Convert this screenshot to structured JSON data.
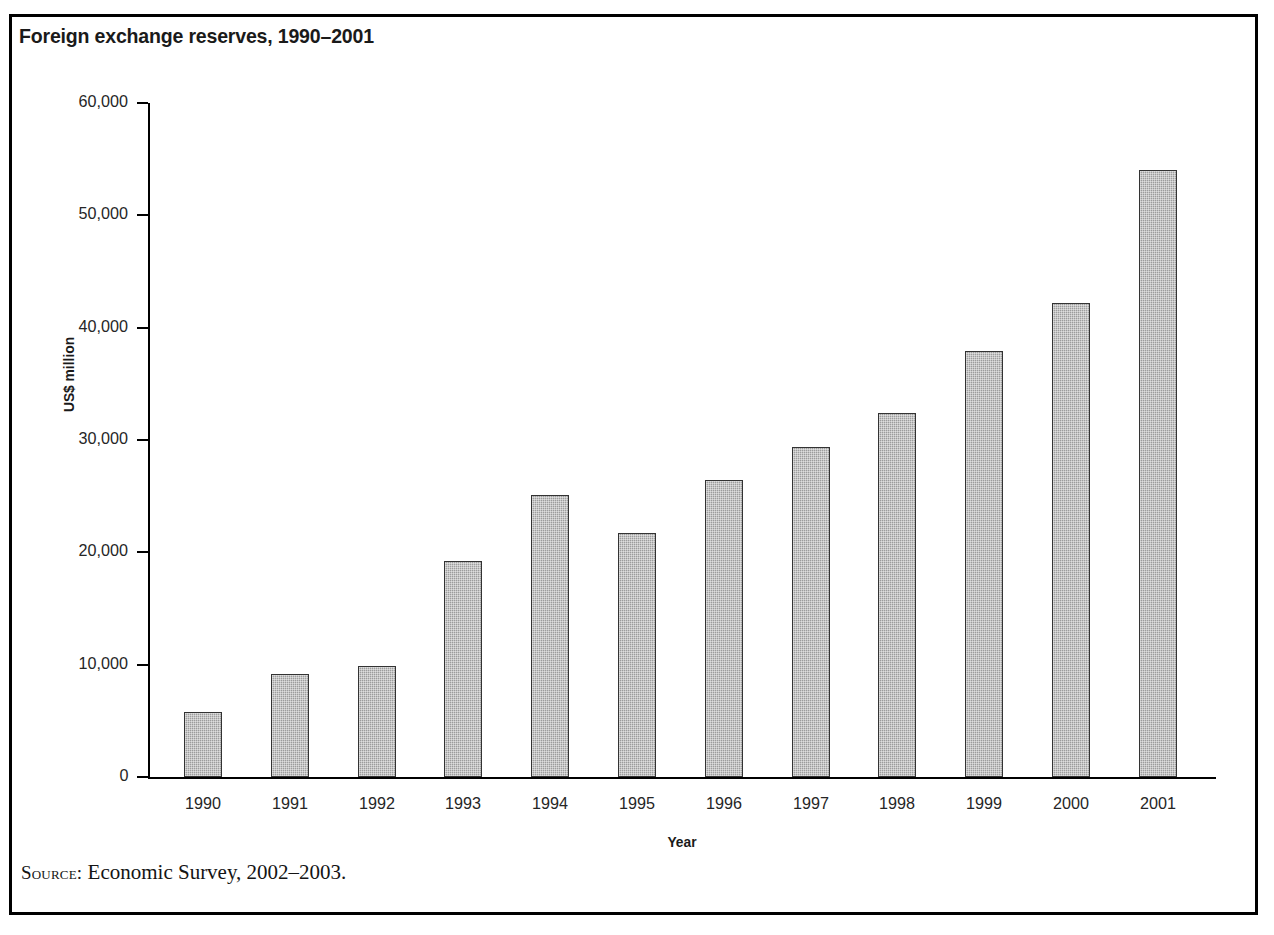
{
  "figure": {
    "title": "Foreign exchange reserves, 1990–2001",
    "source_label": "Source:",
    "source_text": "Economic Survey, 2002–2003.",
    "border_color": "#000000",
    "bar_fill_color": "#9d9d9d",
    "bar_edge_color": "#333333"
  },
  "chart_data": {
    "type": "bar",
    "title": "Foreign exchange reserves, 1990–2001",
    "xlabel": "Year",
    "ylabel": "US$ million",
    "categories": [
      "1990",
      "1991",
      "1992",
      "1993",
      "1994",
      "1995",
      "1996",
      "1997",
      "1998",
      "1999",
      "2000",
      "2001"
    ],
    "values": [
      5800,
      9200,
      9900,
      19200,
      25100,
      21700,
      26400,
      29400,
      32400,
      37900,
      42200,
      54000
    ],
    "ylim": [
      0,
      60000
    ],
    "yticks": [
      0,
      10000,
      20000,
      30000,
      40000,
      50000,
      60000
    ],
    "ytick_labels": [
      "0",
      "10,000",
      "20,000",
      "30,000",
      "40,000",
      "50,000",
      "60,000"
    ],
    "grid": false,
    "legend": false
  }
}
